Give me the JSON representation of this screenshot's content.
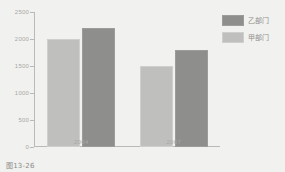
{
  "caption": "图13-26",
  "legend": {
    "position": "top-right",
    "items": [
      {
        "label": "乙部门",
        "color": "#8e8e8c",
        "swatch": "dark"
      },
      {
        "label": "甲部门",
        "color": "#bfbfbd",
        "swatch": "light"
      }
    ]
  },
  "axes": {
    "y_ticks": [
      "0",
      "500",
      "1000",
      "1500",
      "2000",
      "2500"
    ],
    "x_ticks": [
      "2004",
      "2007"
    ]
  },
  "chart_data": {
    "type": "bar",
    "title": "",
    "subtitle": "",
    "xlabel": "",
    "ylabel": "",
    "categories": [
      "2004",
      "2007"
    ],
    "series": [
      {
        "name": "甲部门",
        "color": "#bfbfbd",
        "values": [
          2000,
          1500
        ]
      },
      {
        "name": "乙部门",
        "color": "#8e8e8c",
        "values": [
          2200,
          1800
        ]
      }
    ],
    "series_draw_order": [
      "甲部门",
      "乙部门"
    ],
    "ylim": [
      0,
      2500
    ],
    "ytick_step": 500,
    "grid": false,
    "legend_position": "top-right",
    "background_color": "#f1f1ef",
    "axis_color": "#b9b9b5"
  }
}
